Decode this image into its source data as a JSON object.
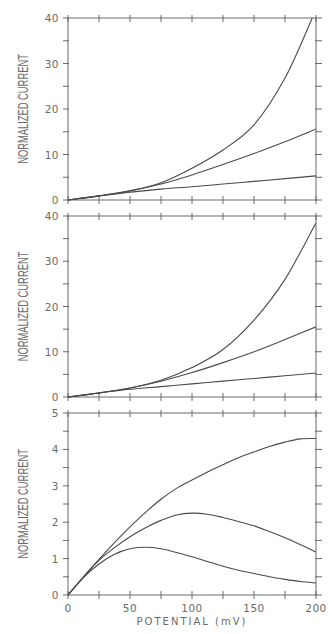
{
  "chart_data": [
    {
      "type": "line",
      "panel": "top",
      "title": "",
      "xlabel": "",
      "ylabel": "NORMALIZED CURRENT",
      "xlim": [
        0,
        200
      ],
      "ylim": [
        0,
        40
      ],
      "xticks": [
        0,
        25,
        50,
        75,
        100,
        125,
        150,
        175,
        200
      ],
      "xtick_labels": [],
      "yticks": [
        0,
        5,
        10,
        15,
        20,
        25,
        30,
        35,
        40
      ],
      "ytick_labels": [
        "0",
        "10",
        "20",
        "30",
        "40"
      ],
      "ytick_label_values": [
        0,
        10,
        20,
        30,
        40
      ],
      "grid": false,
      "x": [
        0,
        25,
        50,
        75,
        100,
        125,
        150,
        175,
        197
      ],
      "series": [
        {
          "name": "curve-1",
          "values": [
            0,
            0.9,
            2.0,
            3.8,
            7.0,
            11.0,
            16.5,
            26.8,
            40.0
          ]
        },
        {
          "name": "curve-2",
          "x": [
            0,
            25,
            50,
            75,
            100,
            125,
            150,
            175,
            200
          ],
          "values": [
            0,
            0.9,
            2.0,
            3.5,
            5.5,
            7.8,
            10.2,
            12.8,
            15.6
          ]
        },
        {
          "name": "curve-3",
          "x": [
            0,
            25,
            50,
            75,
            100,
            125,
            150,
            175,
            200
          ],
          "values": [
            0,
            0.9,
            1.7,
            2.4,
            2.9,
            3.5,
            4.1,
            4.7,
            5.3
          ]
        }
      ]
    },
    {
      "type": "line",
      "panel": "middle",
      "title": "",
      "xlabel": "",
      "ylabel": "NORMALIZED CURRENT",
      "xlim": [
        0,
        200
      ],
      "ylim": [
        0,
        40
      ],
      "xticks": [
        0,
        25,
        50,
        75,
        100,
        125,
        150,
        175,
        200
      ],
      "xtick_labels": [],
      "yticks": [
        0,
        5,
        10,
        15,
        20,
        25,
        30,
        35,
        40
      ],
      "ytick_labels": [
        "0",
        "10",
        "20",
        "30",
        "40"
      ],
      "ytick_label_values": [
        0,
        10,
        20,
        30,
        40
      ],
      "grid": false,
      "x": [
        0,
        25,
        50,
        75,
        100,
        125,
        150,
        175,
        200
      ],
      "series": [
        {
          "name": "curve-1",
          "values": [
            0,
            0.9,
            2.0,
            3.7,
            6.5,
            10.5,
            17.0,
            26.0,
            38.5
          ]
        },
        {
          "name": "curve-2",
          "values": [
            0,
            0.9,
            2.0,
            3.5,
            5.4,
            7.6,
            10.0,
            12.7,
            15.5
          ]
        },
        {
          "name": "curve-3",
          "values": [
            0,
            0.9,
            1.7,
            2.3,
            2.9,
            3.5,
            4.1,
            4.7,
            5.3
          ]
        }
      ]
    },
    {
      "type": "line",
      "panel": "bottom",
      "title": "",
      "xlabel": "POTENTIAL (mV)",
      "ylabel": "NORMALIZED CURRENT",
      "xlim": [
        0,
        200
      ],
      "ylim": [
        0,
        5
      ],
      "xticks": [
        0,
        25,
        50,
        75,
        100,
        125,
        150,
        175,
        200
      ],
      "xtick_labels": [
        "0",
        "50",
        "100",
        "150",
        "200"
      ],
      "xtick_label_values": [
        0,
        50,
        100,
        150,
        200
      ],
      "yticks": [
        0,
        0.5,
        1,
        1.5,
        2,
        2.5,
        3,
        3.5,
        4,
        4.5,
        5
      ],
      "ytick_labels": [
        "0",
        "1",
        "2",
        "3",
        "4",
        "5"
      ],
      "ytick_label_values": [
        0,
        1,
        2,
        3,
        4,
        5
      ],
      "grid": false,
      "x": [
        0,
        12.5,
        25,
        37.5,
        50,
        62.5,
        75,
        87.5,
        100,
        112.5,
        125,
        137.5,
        150,
        162.5,
        175,
        187.5,
        200
      ],
      "series": [
        {
          "name": "curve-1",
          "values": [
            0,
            0.5,
            0.98,
            1.44,
            1.87,
            2.27,
            2.63,
            2.93,
            3.16,
            3.38,
            3.58,
            3.77,
            3.93,
            4.08,
            4.2,
            4.29,
            4.3
          ]
        },
        {
          "name": "curve-2",
          "values": [
            0,
            0.5,
            0.95,
            1.3,
            1.6,
            1.85,
            2.05,
            2.2,
            2.25,
            2.22,
            2.13,
            2.02,
            1.9,
            1.74,
            1.57,
            1.38,
            1.18
          ]
        },
        {
          "name": "curve-3",
          "values": [
            0,
            0.48,
            0.85,
            1.12,
            1.27,
            1.31,
            1.27,
            1.17,
            1.05,
            0.92,
            0.79,
            0.68,
            0.59,
            0.5,
            0.43,
            0.37,
            0.33
          ]
        }
      ]
    }
  ],
  "layout": {
    "plot_left": 68,
    "plot_right": 316,
    "panels": [
      {
        "top": 18,
        "bottom": 200
      },
      {
        "top": 216,
        "bottom": 397
      },
      {
        "top": 413,
        "bottom": 595
      }
    ]
  }
}
